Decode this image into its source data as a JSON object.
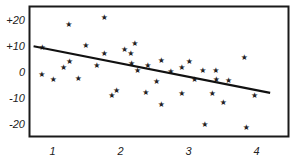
{
  "chart_data": {
    "type": "scatter",
    "title": "",
    "xlabel": "",
    "ylabel": "",
    "xlim": [
      0.66,
      4.47
    ],
    "ylim": [
      -25,
      25.4
    ],
    "grid": false,
    "legend": null,
    "xticks": [
      1,
      2,
      3,
      4
    ],
    "xtick_labels": [
      "1",
      "2",
      "3",
      "4"
    ],
    "yticks": [
      20,
      10,
      0,
      -10,
      -20
    ],
    "ytick_labels": [
      "+20",
      "+10",
      "0",
      "-10",
      "-20"
    ],
    "marker": "star",
    "series": [
      {
        "name": "observations",
        "points": [
          [
            0.85,
            9.6
          ],
          [
            1.24,
            18.5
          ],
          [
            1.49,
            10.4
          ],
          [
            1.25,
            4.2
          ],
          [
            1.16,
            1.9
          ],
          [
            0.84,
            -0.8
          ],
          [
            1.01,
            -2.7
          ],
          [
            1.38,
            -2.3
          ],
          [
            1.76,
            21.2
          ],
          [
            2.21,
            11.2
          ],
          [
            2.06,
            8.8
          ],
          [
            1.76,
            7.3
          ],
          [
            2.15,
            7.3
          ],
          [
            1.65,
            2.7
          ],
          [
            2.16,
            3.5
          ],
          [
            2.25,
            0.8
          ],
          [
            2.4,
            2.7
          ],
          [
            2.53,
            -3.5
          ],
          [
            1.94,
            -6.9
          ],
          [
            1.87,
            -8.8
          ],
          [
            2.37,
            -7.7
          ],
          [
            2.6,
            4.6
          ],
          [
            3.01,
            4.2
          ],
          [
            2.9,
            1.9
          ],
          [
            2.74,
            0.4
          ],
          [
            3.21,
            0.8
          ],
          [
            3.4,
            0.8
          ],
          [
            3.09,
            -2.7
          ],
          [
            3.41,
            -2.7
          ],
          [
            2.9,
            -8.1
          ],
          [
            3.35,
            -8.1
          ],
          [
            2.6,
            -12.3
          ],
          [
            3.24,
            -20.0
          ],
          [
            3.51,
            -11.5
          ],
          [
            3.82,
            5.8
          ],
          [
            3.59,
            -3.1
          ],
          [
            3.97,
            -8.8
          ],
          [
            3.85,
            -21.2
          ]
        ]
      }
    ],
    "regression_line": {
      "x": [
        0.72,
        4.2
      ],
      "y": [
        10.0,
        -8.1
      ]
    }
  },
  "colors": {
    "axis": "#1a1a1a",
    "line": "#111111",
    "marker": "#222222",
    "background": "#ffffff"
  }
}
